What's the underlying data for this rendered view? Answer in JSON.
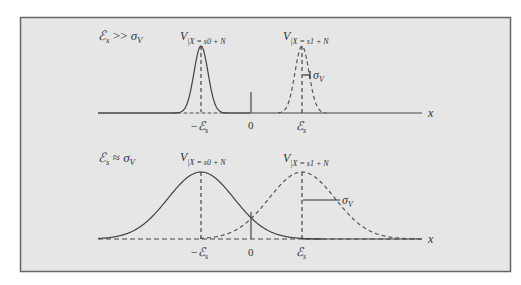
{
  "figure": {
    "background": "#e6e6e6",
    "border_color": "#555555",
    "curve_color": "#444444",
    "panels": [
      {
        "id": "top",
        "condition": "ℰs >> σV",
        "left_label": "V|X = s0 + N",
        "right_label": "V|X = s1 + N",
        "sigma_label": "σV",
        "tick_neg": "−ℰs",
        "tick_zero": "0",
        "tick_pos": "ℰs",
        "axis_label": "x"
      },
      {
        "id": "bottom",
        "condition": "ℰs ≈ σV",
        "left_label": "V|X = s0 + N",
        "right_label": "V|X = s1 + N",
        "sigma_label": "σV",
        "tick_neg": "−ℰs",
        "tick_zero": "0",
        "tick_pos": "ℰs",
        "axis_label": "x"
      }
    ]
  }
}
